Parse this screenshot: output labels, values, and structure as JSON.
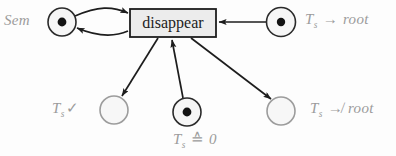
{
  "figure": {
    "type": "petri-net",
    "background_color": "#fdfdfd",
    "label_color": "#9b9b9b",
    "stroke_color": "#1d1d1d",
    "place_fill": "#f4f4f4",
    "transition_fill": "#ececec",
    "transition": {
      "name": "disappear",
      "label": "disappear",
      "x": 130,
      "y": 9,
      "width": 86,
      "height": 28
    },
    "places": [
      {
        "id": "sem",
        "label": "Sem",
        "label_parts": {
          "base": "Sem",
          "sub": "",
          "op": "",
          "tail": ""
        },
        "cx": 62,
        "cy": 22,
        "r": 14,
        "tokens": 1
      },
      {
        "id": "ts_root",
        "label": "Ts -> root",
        "label_parts": {
          "base": "T",
          "sub": "s",
          "op": "→",
          "tail": "root"
        },
        "cx": 281,
        "cy": 22,
        "r": 14,
        "tokens": 1
      },
      {
        "id": "ts_check",
        "label": "Ts ✓",
        "label_parts": {
          "base": "T",
          "sub": "s",
          "op": "✓",
          "tail": ""
        },
        "cx": 114,
        "cy": 110,
        "r": 14,
        "tokens": 0
      },
      {
        "id": "ts_zero",
        "label": "Ts ≙ 0",
        "label_parts": {
          "base": "T",
          "sub": "s",
          "op": "≙",
          "tail": "0"
        },
        "cx": 187,
        "cy": 112,
        "r": 14,
        "tokens": 1
      },
      {
        "id": "ts_nroot",
        "label": "Ts ↛ root",
        "label_parts": {
          "base": "T",
          "sub": "s",
          "op": "↛",
          "tail": "root"
        },
        "cx": 281,
        "cy": 111,
        "r": 14,
        "tokens": 0
      }
    ],
    "arcs": [
      {
        "from": "sem",
        "to": "disappear",
        "direction": "place-to-transition",
        "style": "curved"
      },
      {
        "from": "disappear",
        "to": "sem",
        "direction": "transition-to-place",
        "style": "curved"
      },
      {
        "from": "ts_root",
        "to": "disappear",
        "direction": "place-to-transition",
        "style": "straight"
      },
      {
        "from": "disappear",
        "to": "ts_check",
        "direction": "transition-to-place",
        "style": "straight"
      },
      {
        "from": "ts_zero",
        "to": "disappear",
        "direction": "place-to-transition",
        "style": "straight"
      },
      {
        "from": "disappear",
        "to": "ts_nroot",
        "direction": "transition-to-place",
        "style": "straight"
      }
    ]
  }
}
